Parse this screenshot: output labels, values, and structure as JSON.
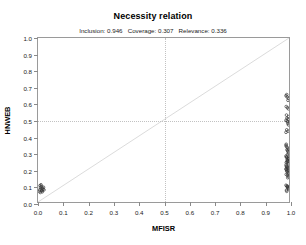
{
  "chart_data": {
    "type": "scatter",
    "title": "Necessity relation",
    "subtitle": "Inclusion: 0.946   Coverage: 0.307   Relevance: 0.336",
    "stats": {
      "inclusion_label": "Inclusion:",
      "inclusion_value": "0.946",
      "coverage_label": "Coverage:",
      "coverage_value": "0.307",
      "relevance_label": "Relevance:",
      "relevance_value": "0.336"
    },
    "xlabel": "MFISR",
    "ylabel": "HNWEB",
    "xlim": [
      0.0,
      1.0
    ],
    "ylim": [
      0.0,
      1.0
    ],
    "xticks": [
      "0.0",
      "0.1",
      "0.2",
      "0.3",
      "0.4",
      "0.5",
      "0.6",
      "0.7",
      "0.8",
      "0.9",
      "1.0"
    ],
    "yticks": [
      "0.0",
      "0.1",
      "0.2",
      "0.3",
      "0.4",
      "0.5",
      "0.6",
      "0.7",
      "0.8",
      "0.9",
      "1.0"
    ],
    "xtick_values": [
      0.0,
      0.1,
      0.2,
      0.3,
      0.4,
      0.5,
      0.6,
      0.7,
      0.8,
      0.9,
      1.0
    ],
    "ytick_values": [
      0.0,
      0.1,
      0.2,
      0.3,
      0.4,
      0.5,
      0.6,
      0.7,
      0.8,
      0.9,
      1.0
    ],
    "grid": false,
    "legend": null,
    "reference_lines": [
      {
        "name": "vertical-threshold",
        "orientation": "vertical",
        "value": 0.5,
        "style": "dotted",
        "color": "#c2c2c2"
      },
      {
        "name": "horizontal-threshold",
        "orientation": "horizontal",
        "value": 0.5,
        "style": "dotted",
        "color": "#c2c2c2"
      },
      {
        "name": "diagonal-identity",
        "orientation": "diagonal",
        "from": [
          0.0,
          0.0
        ],
        "to": [
          1.0,
          1.0
        ],
        "style": "solid",
        "color": "#bdbdbd"
      }
    ],
    "point_color": "#3a3a3a",
    "point_radius": 1.35,
    "points": [
      [
        0.005,
        0.075
      ],
      [
        0.01,
        0.08
      ],
      [
        0.014,
        0.072
      ],
      [
        0.008,
        0.09
      ],
      [
        0.016,
        0.085
      ],
      [
        0.004,
        0.065
      ],
      [
        0.012,
        0.095
      ],
      [
        0.018,
        0.078
      ],
      [
        0.007,
        0.058
      ],
      [
        0.013,
        0.068
      ],
      [
        0.02,
        0.09
      ],
      [
        0.006,
        0.1
      ],
      [
        0.015,
        0.062
      ],
      [
        0.01,
        0.105
      ],
      [
        0.022,
        0.074
      ],
      [
        0.995,
        0.64
      ],
      [
        1.0,
        0.632
      ],
      [
        0.99,
        0.648
      ],
      [
        0.998,
        0.62
      ],
      [
        0.993,
        0.655
      ],
      [
        0.996,
        0.575
      ],
      [
        1.0,
        0.568
      ],
      [
        0.991,
        0.582
      ],
      [
        0.994,
        0.512
      ],
      [
        0.999,
        0.505
      ],
      [
        0.99,
        0.498
      ],
      [
        1.0,
        0.52
      ],
      [
        0.996,
        0.488
      ],
      [
        0.992,
        0.53
      ],
      [
        0.998,
        0.478
      ],
      [
        0.995,
        0.495
      ],
      [
        1.0,
        0.47
      ],
      [
        0.993,
        0.44
      ],
      [
        0.998,
        0.432
      ],
      [
        0.99,
        0.425
      ],
      [
        0.996,
        0.33
      ],
      [
        1.0,
        0.322
      ],
      [
        0.992,
        0.338
      ],
      [
        0.997,
        0.312
      ],
      [
        0.99,
        0.345
      ],
      [
        0.999,
        0.305
      ],
      [
        0.994,
        0.318
      ],
      [
        1.0,
        0.296
      ],
      [
        0.991,
        0.352
      ],
      [
        0.996,
        0.288
      ],
      [
        0.993,
        0.275
      ],
      [
        0.998,
        0.268
      ],
      [
        0.99,
        0.28
      ],
      [
        1.0,
        0.262
      ],
      [
        0.995,
        0.255
      ],
      [
        0.992,
        0.272
      ],
      [
        0.997,
        0.248
      ],
      [
        0.999,
        0.265
      ],
      [
        0.991,
        0.24
      ],
      [
        0.996,
        0.258
      ],
      [
        1.0,
        0.232
      ],
      [
        0.994,
        0.245
      ],
      [
        0.99,
        0.225
      ],
      [
        0.998,
        0.238
      ],
      [
        0.993,
        0.218
      ],
      [
        0.997,
        0.212
      ],
      [
        1.0,
        0.205
      ],
      [
        0.991,
        0.198
      ],
      [
        0.995,
        0.208
      ],
      [
        0.999,
        0.192
      ],
      [
        0.992,
        0.215
      ],
      [
        0.996,
        0.185
      ],
      [
        0.99,
        0.202
      ],
      [
        1.0,
        0.178
      ],
      [
        0.994,
        0.195
      ],
      [
        0.998,
        0.17
      ],
      [
        0.993,
        0.188
      ],
      [
        0.996,
        0.162
      ],
      [
        1.0,
        0.155
      ],
      [
        0.991,
        0.168
      ],
      [
        0.997,
        0.148
      ],
      [
        0.994,
        0.095
      ],
      [
        0.999,
        0.088
      ],
      [
        0.99,
        0.102
      ],
      [
        1.0,
        0.08
      ],
      [
        0.996,
        0.092
      ],
      [
        0.992,
        0.072
      ],
      [
        0.998,
        0.085
      ],
      [
        0.993,
        0.065
      ],
      [
        0.995,
        0.098
      ]
    ]
  }
}
